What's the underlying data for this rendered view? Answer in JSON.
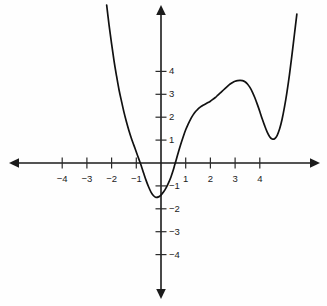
{
  "chart_data": {
    "type": "line",
    "title": "",
    "subtitle": "",
    "xlabel": "",
    "ylabel": "",
    "xlim": [
      -6.1,
      6.4
    ],
    "ylim": [
      -5.9,
      6.4
    ],
    "grid": false,
    "legend": "none",
    "axis_style": "cartesian-arrows",
    "x_ticks": [
      -4,
      -3,
      -2,
      -1,
      1,
      2,
      3,
      4
    ],
    "x_tick_labels": [
      "−4",
      "−3",
      "−2",
      "−1",
      "1",
      "2",
      "3",
      "4"
    ],
    "y_ticks": [
      4,
      3,
      2,
      1,
      -1,
      -2,
      -3,
      -4
    ],
    "y_tick_labels": [
      "4",
      "3",
      "2",
      "1",
      "−1",
      "−2",
      "−3",
      "−4"
    ],
    "series": [
      {
        "name": "quartic curve",
        "color": "#111111",
        "x_roots": [
          -0.9,
          0.55,
          1.6,
          4.95
        ],
        "local_extrema": [
          {
            "kind": "local-min",
            "x": -0.2,
            "y": -1.5
          },
          {
            "kind": "local-max",
            "x": 3.3,
            "y": 3.6
          },
          {
            "kind": "local-min",
            "x": 4.4,
            "y": 1.05
          }
        ],
        "y_intercept": -1.4,
        "x_domain": [
          -2.2,
          6.45
        ],
        "points": [
          [
            -2.2,
            6.9
          ],
          [
            -2.1,
            6.0
          ],
          [
            -2.0,
            5.2
          ],
          [
            -1.9,
            4.45
          ],
          [
            -1.8,
            3.8
          ],
          [
            -1.7,
            3.2
          ],
          [
            -1.6,
            2.7
          ],
          [
            -1.5,
            2.22
          ],
          [
            -1.4,
            1.8
          ],
          [
            -1.3,
            1.42
          ],
          [
            -1.2,
            1.08
          ],
          [
            -1.1,
            0.78
          ],
          [
            -1.0,
            0.48
          ],
          [
            -0.9,
            0.18
          ],
          [
            -0.8,
            -0.12
          ],
          [
            -0.7,
            -0.45
          ],
          [
            -0.6,
            -0.77
          ],
          [
            -0.5,
            -1.05
          ],
          [
            -0.4,
            -1.28
          ],
          [
            -0.3,
            -1.43
          ],
          [
            -0.2,
            -1.5
          ],
          [
            -0.1,
            -1.48
          ],
          [
            0.0,
            -1.4
          ],
          [
            0.1,
            -1.27
          ],
          [
            0.2,
            -1.1
          ],
          [
            0.3,
            -0.88
          ],
          [
            0.4,
            -0.62
          ],
          [
            0.5,
            -0.3
          ],
          [
            0.55,
            -0.1
          ],
          [
            0.6,
            0.08
          ],
          [
            0.7,
            0.46
          ],
          [
            0.8,
            0.82
          ],
          [
            0.9,
            1.15
          ],
          [
            1.0,
            1.45
          ],
          [
            1.1,
            1.7
          ],
          [
            1.2,
            1.92
          ],
          [
            1.3,
            2.1
          ],
          [
            1.4,
            2.25
          ],
          [
            1.5,
            2.36
          ],
          [
            1.6,
            2.45
          ],
          [
            1.7,
            2.52
          ],
          [
            1.8,
            2.58
          ],
          [
            1.9,
            2.64
          ],
          [
            2.0,
            2.7
          ],
          [
            2.1,
            2.78
          ],
          [
            2.2,
            2.86
          ],
          [
            2.3,
            2.96
          ],
          [
            2.4,
            3.06
          ],
          [
            2.5,
            3.16
          ],
          [
            2.6,
            3.26
          ],
          [
            2.7,
            3.36
          ],
          [
            2.8,
            3.45
          ],
          [
            2.9,
            3.52
          ],
          [
            3.0,
            3.57
          ],
          [
            3.1,
            3.6
          ],
          [
            3.2,
            3.61
          ],
          [
            3.3,
            3.6
          ],
          [
            3.4,
            3.55
          ],
          [
            3.5,
            3.45
          ],
          [
            3.6,
            3.3
          ],
          [
            3.7,
            3.1
          ],
          [
            3.8,
            2.85
          ],
          [
            3.9,
            2.56
          ],
          [
            4.0,
            2.25
          ],
          [
            4.1,
            1.92
          ],
          [
            4.2,
            1.62
          ],
          [
            4.3,
            1.35
          ],
          [
            4.4,
            1.15
          ],
          [
            4.5,
            1.05
          ],
          [
            4.6,
            1.06
          ],
          [
            4.7,
            1.2
          ],
          [
            4.8,
            1.48
          ],
          [
            4.9,
            1.9
          ],
          [
            5.0,
            2.45
          ],
          [
            5.1,
            3.1
          ],
          [
            5.2,
            3.85
          ],
          [
            5.3,
            4.7
          ],
          [
            5.4,
            5.6
          ],
          [
            5.5,
            6.5
          ]
        ]
      }
    ]
  },
  "curve_note": "",
  "canvas": {
    "origin_x_px": 161,
    "origin_y_px": 163,
    "unit_x_px": 24.7,
    "unit_y_px": 22.9
  }
}
